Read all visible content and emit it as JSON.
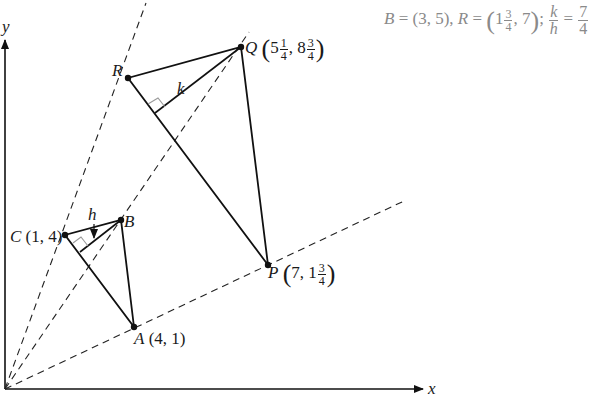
{
  "caption": {
    "b_label": "B",
    "b_value": "= (3, 5), ",
    "r_label": "R",
    "r_eq": "= ",
    "r_whole": "1",
    "r_num": "3",
    "r_den": "4",
    "r_rest": ", 7",
    "sep": ";",
    "ratio_num": "k",
    "ratio_den": "h",
    "ratio_eq": " = ",
    "ratio_val_num": "7",
    "ratio_val_den": "4"
  },
  "axes": {
    "x_label": "x",
    "y_label": "y"
  },
  "points": {
    "A": {
      "name": "A",
      "coords": "(4, 1)"
    },
    "B": {
      "name": "B"
    },
    "C": {
      "name": "C",
      "coords": "(1, 4)"
    },
    "P": {
      "name": "P",
      "whole_x": "7",
      "whole_y": "1",
      "num_y": "3",
      "den_y": "4"
    },
    "Q": {
      "name": "Q",
      "whole_x": "5",
      "num_x": "1",
      "den_x": "4",
      "whole_y": "8",
      "num_y": "3",
      "den_y": "4"
    },
    "R": {
      "name": "R"
    }
  },
  "heights": {
    "small": "h",
    "large": "k"
  },
  "colors": {
    "line": "#111111",
    "caption": "#8a8a8a",
    "right_angle": "#999999"
  }
}
